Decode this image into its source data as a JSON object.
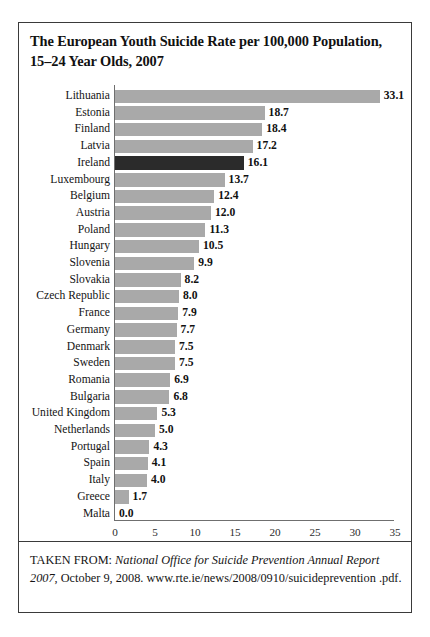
{
  "figure": {
    "title": "The European Youth Suicide Rate per 100,000 Population, 15–24 Year Olds, 2007",
    "caption_prefix": "TAKEN FROM: ",
    "caption_italic": "National Office for Suicide Prevention Annual Report 2007",
    "caption_rest": ", October 9, 2008. www.rte.ie/news/2008/0910/suicideprevention .pdf.",
    "border_color": "#3a3a3a"
  },
  "chart_data": {
    "type": "bar",
    "orientation": "horizontal",
    "title": "The European Youth Suicide Rate per 100,000 Population, 15–24 Year Olds, 2007",
    "xlabel": "",
    "ylabel": "",
    "xlim": [
      0,
      35
    ],
    "xticks": [
      0,
      5,
      10,
      15,
      20,
      25,
      30,
      35
    ],
    "grid": false,
    "legend": false,
    "bar_color": "#a9a9a9",
    "highlight_color": "#2b2b2b",
    "highlight_category": "Ireland",
    "categories": [
      "Lithuania",
      "Estonia",
      "Finland",
      "Latvia",
      "Ireland",
      "Luxembourg",
      "Belgium",
      "Austria",
      "Poland",
      "Hungary",
      "Slovenia",
      "Slovakia",
      "Czech Republic",
      "France",
      "Germany",
      "Denmark",
      "Sweden",
      "Romania",
      "Bulgaria",
      "United Kingdom",
      "Netherlands",
      "Portugal",
      "Spain",
      "Italy",
      "Greece",
      "Malta"
    ],
    "values": [
      33.1,
      18.7,
      18.4,
      17.2,
      16.1,
      13.7,
      12.4,
      12.0,
      11.3,
      10.5,
      9.9,
      8.2,
      8.0,
      7.9,
      7.7,
      7.5,
      7.5,
      6.9,
      6.8,
      5.3,
      5.0,
      4.3,
      4.1,
      4.0,
      1.7,
      0.0
    ],
    "value_labels": [
      "33.1",
      "18.7",
      "18.4",
      "17.2",
      "16.1",
      "13.7",
      "12.4",
      "12.0",
      "11.3",
      "10.5",
      "9.9",
      "8.2",
      "8.0",
      "7.9",
      "7.7",
      "7.5",
      "7.5",
      "6.9",
      "6.8",
      "5.3",
      "5.0",
      "4.3",
      "4.1",
      "4.0",
      "1.7",
      "0.0"
    ]
  }
}
